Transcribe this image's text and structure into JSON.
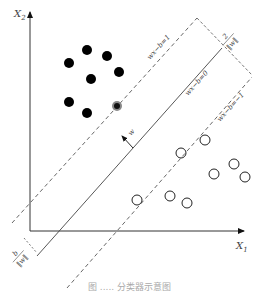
{
  "diagram": {
    "axes": {
      "x_label": "X",
      "x_sub": "1",
      "y_label": "X",
      "y_sub": "2"
    },
    "lines": {
      "upper_margin": "wx−b=1",
      "hyperplane": "wx−b=0",
      "lower_margin": "wx−b=−1"
    },
    "annotations": {
      "margin_width_num": "2",
      "margin_width_den": "‖w‖",
      "normal_vector": "w",
      "offset_num": "b",
      "offset_den": "‖w‖"
    },
    "class_positive": {
      "marker": "filled-circle",
      "color": "#000000",
      "points": [
        [
          87,
          50
        ],
        [
          107,
          56
        ],
        [
          69,
          63
        ],
        [
          91,
          79
        ],
        [
          119,
          72
        ],
        [
          69,
          102
        ],
        [
          87,
          113
        ]
      ],
      "support_vectors": [
        [
          117,
          106
        ]
      ]
    },
    "class_negative": {
      "marker": "open-circle",
      "color": "#000000",
      "points": [
        [
          205,
          140
        ],
        [
          234,
          164
        ],
        [
          214,
          174
        ],
        [
          245,
          177
        ],
        [
          170,
          196
        ],
        [
          187,
          203
        ]
      ],
      "support_vectors": [
        [
          181,
          153
        ],
        [
          137,
          200
        ]
      ]
    },
    "caption": "图 ..... 分类器示意图"
  }
}
